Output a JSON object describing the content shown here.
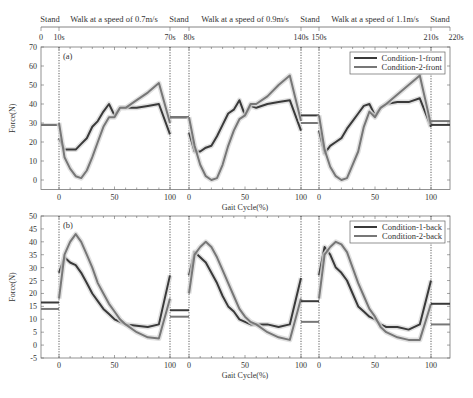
{
  "timeline": {
    "segments": [
      "Stand",
      "Walk at a speed of 0.7m/s",
      "Stand",
      "Walk at a speed of 0.9m/s",
      "Stand",
      "Walk at a speed of 1.1m/s",
      "Stand"
    ],
    "ticks": [
      "0",
      "10s",
      "70s",
      "80s",
      "140s",
      "150s",
      "210s",
      "220s"
    ]
  },
  "colors": {
    "condition1": "#3a3a3a",
    "condition2": "#777777",
    "band": "#d8d8d8"
  },
  "chart_data": [
    {
      "type": "line",
      "panel": "(a)",
      "title": "",
      "xlabel": "Gait Cycle(%)",
      "ylabel": "Force(N)",
      "ylim": [
        -5,
        70
      ],
      "yticks": [
        "0",
        "10",
        "20",
        "30",
        "40",
        "50",
        "60",
        "70"
      ],
      "xticks_per_segment": [
        "0",
        "50",
        "100"
      ],
      "legend": [
        "Condition-1-front",
        "Condition-2-front"
      ],
      "legend_position": "upper right",
      "segments": [
        {
          "speed": "0.7m/s",
          "stand_before": {
            "condition1": 29,
            "condition2": 29
          },
          "x": [
            0,
            5,
            10,
            15,
            20,
            25,
            30,
            35,
            40,
            45,
            50,
            55,
            60,
            70,
            80,
            90,
            100
          ],
          "series": [
            {
              "name": "Condition-1-front",
              "values": [
                22,
                16,
                16,
                16,
                19,
                22,
                28,
                31,
                36,
                40,
                34,
                38,
                38,
                38,
                39,
                40,
                24
              ]
            },
            {
              "name": "Condition-2-front",
              "values": [
                30,
                12,
                6,
                2,
                1,
                5,
                12,
                20,
                28,
                33,
                33,
                38,
                38,
                42,
                46,
                51,
                30
              ]
            }
          ]
        },
        {
          "speed": "0.9m/s",
          "stand_before": {
            "condition1": 33,
            "condition2": 33
          },
          "x": [
            0,
            5,
            10,
            15,
            20,
            25,
            30,
            35,
            40,
            45,
            50,
            55,
            60,
            70,
            80,
            90,
            100
          ],
          "series": [
            {
              "name": "Condition-1-front",
              "values": [
                25,
                15,
                15,
                17,
                18,
                23,
                29,
                35,
                37,
                42,
                34,
                39,
                38,
                40,
                41,
                42,
                26
              ]
            },
            {
              "name": "Condition-2-front",
              "values": [
                33,
                18,
                8,
                2,
                0,
                1,
                8,
                18,
                26,
                32,
                34,
                40,
                40,
                44,
                50,
                55,
                31
              ]
            }
          ]
        },
        {
          "speed": "1.1m/s",
          "stand_before": {
            "condition1": 34,
            "condition2": 30
          },
          "x": [
            0,
            5,
            10,
            15,
            20,
            25,
            30,
            35,
            40,
            45,
            50,
            55,
            60,
            70,
            80,
            90,
            100
          ],
          "series": [
            {
              "name": "Condition-1-front",
              "values": [
                26,
                14,
                18,
                20,
                22,
                27,
                31,
                35,
                39,
                40,
                34,
                38,
                40,
                41,
                41,
                43,
                28
              ]
            },
            {
              "name": "Condition-2-front",
              "values": [
                34,
                16,
                7,
                2,
                0,
                1,
                8,
                15,
                28,
                36,
                33,
                38,
                40,
                45,
                50,
                55,
                29
              ]
            }
          ]
        }
      ]
    },
    {
      "type": "line",
      "panel": "(b)",
      "title": "",
      "xlabel": "Gait Cycle(%)",
      "ylabel": "Force(N)",
      "ylim": [
        -5,
        50
      ],
      "yticks": [
        "-5",
        "0",
        "5",
        "10",
        "15",
        "20",
        "25",
        "30",
        "35",
        "40",
        "45",
        "50"
      ],
      "xticks_per_segment": [
        "0",
        "50",
        "100"
      ],
      "legend": [
        "Condition-1-back",
        "Condition-2-back"
      ],
      "legend_position": "upper right",
      "segments": [
        {
          "speed": "0.7m/s",
          "stand_before": {
            "condition1": 16.5,
            "condition2": 14
          },
          "x": [
            0,
            5,
            10,
            15,
            20,
            25,
            30,
            35,
            40,
            45,
            50,
            55,
            60,
            70,
            80,
            90,
            100
          ],
          "series": [
            {
              "name": "Condition-1-back",
              "values": [
                28,
                34,
                32,
                31,
                28,
                24,
                20,
                17,
                14,
                12,
                10,
                9,
                8,
                7.5,
                7,
                8,
                27
              ]
            },
            {
              "name": "Condition-2-back",
              "values": [
                18,
                35,
                40,
                43,
                40,
                35,
                30,
                24,
                20,
                16,
                13,
                10,
                8,
                5,
                3,
                2.5,
                18
              ]
            }
          ]
        },
        {
          "speed": "0.9m/s",
          "stand_before": {
            "condition1": 13.5,
            "condition2": 11
          },
          "x": [
            0,
            5,
            10,
            15,
            20,
            25,
            30,
            35,
            40,
            45,
            50,
            55,
            60,
            70,
            80,
            90,
            100
          ],
          "series": [
            {
              "name": "Condition-1-back",
              "values": [
                27,
                36,
                34,
                32,
                28,
                24,
                19,
                15,
                13,
                10,
                9,
                8,
                8,
                8,
                7,
                8,
                26
              ]
            },
            {
              "name": "Condition-2-back",
              "values": [
                20,
                35,
                38,
                40,
                38,
                34,
                29,
                24,
                19,
                14,
                11,
                9,
                8,
                5,
                3,
                2,
                18
              ]
            }
          ]
        },
        {
          "speed": "1.1m/s",
          "stand_before": {
            "condition1": 17,
            "condition2": 9
          },
          "x": [
            0,
            5,
            10,
            15,
            20,
            25,
            30,
            35,
            40,
            45,
            50,
            55,
            60,
            70,
            80,
            90,
            100
          ],
          "series": [
            {
              "name": "Condition-1-back",
              "values": [
                27,
                38,
                35,
                30,
                28,
                25,
                20,
                15,
                13,
                11,
                10,
                8,
                7,
                7,
                6,
                8,
                25
              ]
            },
            {
              "name": "Condition-2-back",
              "values": [
                18,
                35,
                38,
                40,
                39,
                36,
                30,
                24,
                19,
                14,
                11,
                7,
                5,
                3,
                2,
                2,
                16
              ]
            }
          ]
        }
      ],
      "stand_after": {
        "condition1": 16,
        "condition2": 8
      }
    }
  ]
}
